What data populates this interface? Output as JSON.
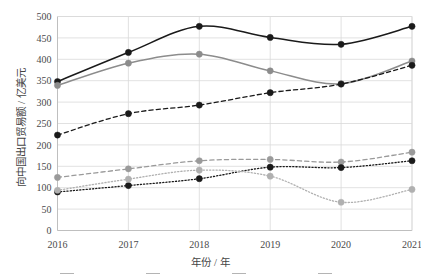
{
  "chart_data": {
    "type": "line",
    "title": "",
    "xlabel": "年份 / 年",
    "ylabel": "向中国出口贸易额 / 亿美元",
    "categories": [
      "2016",
      "2017",
      "2018",
      "2019",
      "2020",
      "2021"
    ],
    "x": [
      2016,
      2017,
      2018,
      2019,
      2020,
      2021
    ],
    "xlim": [
      2016,
      2021
    ],
    "ylim": [
      0,
      500
    ],
    "ytick_labels": [
      "0",
      "50",
      "100",
      "150",
      "200",
      "250",
      "300",
      "350",
      "400",
      "450",
      "500"
    ],
    "ytick_values": [
      0,
      50,
      100,
      150,
      200,
      250,
      300,
      350,
      400,
      450,
      500
    ],
    "xtick_labels": [
      "2016",
      "2017",
      "2018",
      "2019",
      "2020",
      "2021"
    ],
    "grid": true,
    "grid_axis": "both",
    "legend_position": "bottom",
    "legend_cropped": true,
    "smoothed_lines": true,
    "series": [
      {
        "name": "series-1",
        "color": "#1a1a1a",
        "style": "solid",
        "marker": "circle",
        "values": [
          348,
          416,
          477,
          451,
          435,
          477
        ]
      },
      {
        "name": "series-2",
        "color": "#8c8c8c",
        "style": "solid",
        "marker": "circle",
        "values": [
          339,
          391,
          412,
          373,
          343,
          396
        ]
      },
      {
        "name": "series-3",
        "color": "#1a1a1a",
        "style": "dashed",
        "marker": "circle",
        "values": [
          223,
          273,
          293,
          322,
          342,
          386
        ]
      },
      {
        "name": "series-4",
        "color": "#9a9a9a",
        "style": "dashed",
        "marker": "circle",
        "values": [
          124,
          144,
          163,
          166,
          160,
          183
        ]
      },
      {
        "name": "series-5",
        "color": "#1a1a1a",
        "style": "dotted",
        "marker": "circle",
        "values": [
          90,
          105,
          121,
          148,
          147,
          163
        ]
      },
      {
        "name": "series-6",
        "color": "#b0b0b0",
        "style": "dotted",
        "marker": "circle",
        "values": [
          94,
          120,
          141,
          127,
          66,
          96
        ]
      }
    ]
  },
  "legend": {
    "cropped_note": "",
    "entries": [
      {
        "label": ""
      },
      {
        "label": ""
      },
      {
        "label": ""
      },
      {
        "label": ""
      }
    ]
  }
}
